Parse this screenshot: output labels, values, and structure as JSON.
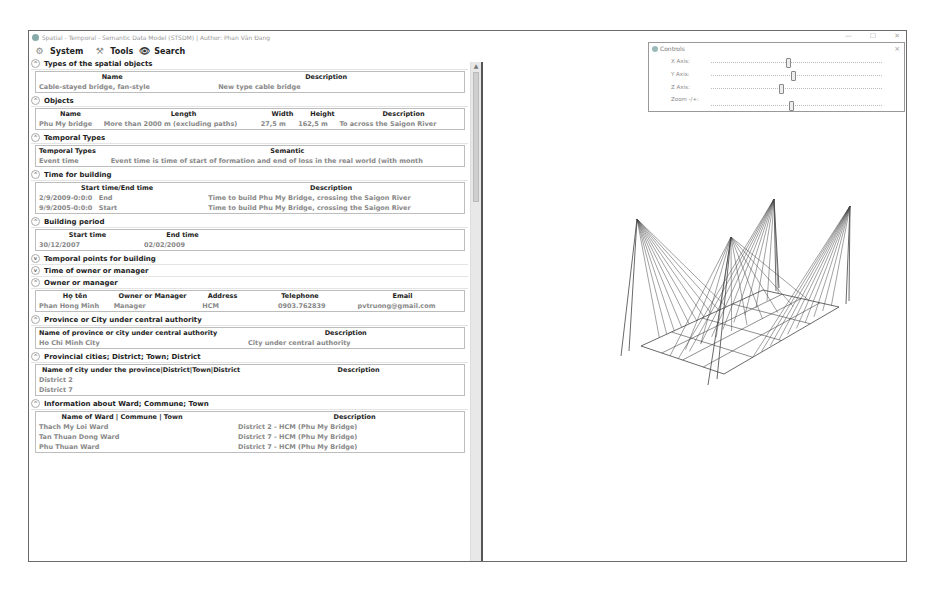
{
  "window": {
    "title": "Spatial - Temporal - Semantic Data Model (STSDM) | Author: Phan Văn Đang",
    "buttons": {
      "minimize": "—",
      "maximize": "☐",
      "close": "✕"
    }
  },
  "toolbar": {
    "system_label": "System",
    "tools_label": "Tools",
    "search_label": "Search"
  },
  "sections": {
    "spatial_types": {
      "title": "Types of the spatial objects",
      "headers": [
        "Name",
        "Description"
      ],
      "rows": [
        [
          "Cable-stayed bridge, fan-style",
          "New type cable bridge"
        ]
      ]
    },
    "objects": {
      "title": "Objects",
      "headers": [
        "Name",
        "Length",
        "Width",
        "Height",
        "Description"
      ],
      "rows": [
        [
          "Phu My bridge",
          "More than 2000 m (excluding paths)",
          "27,5 m",
          "162,5 m",
          "To across the Saigon River"
        ]
      ]
    },
    "temporal_types": {
      "title": "Temporal Types",
      "headers": [
        "Temporal Types",
        "Semantic"
      ],
      "rows": [
        [
          "Event time",
          "Event time is time of start of formation and end of loss in the real world (with month"
        ]
      ]
    },
    "time_building": {
      "title": "Time for building",
      "headers": [
        "Start time/End time",
        "Description"
      ],
      "rows": [
        [
          "2/9/2009-0:0:0",
          "End",
          "Time to build Phu My Bridge, crossing the Saigon River"
        ],
        [
          "9/9/2005-0:0:0",
          "Start",
          "Time to build Phu My Bridge, crossing the Saigon River"
        ]
      ]
    },
    "building_period": {
      "title": "Building period",
      "headers": [
        "Start time",
        "End time"
      ],
      "rows": [
        [
          "30/12/2007",
          "02/02/2009"
        ]
      ]
    },
    "temporal_points": {
      "title": "Temporal points for building"
    },
    "time_owner": {
      "title": "Time of owner or manager"
    },
    "owner": {
      "title": "Owner or manager",
      "headers": [
        "Họ tên",
        "Owner or Manager",
        "Address",
        "Telephone",
        "Email"
      ],
      "rows": [
        [
          "Phan Hong Minh",
          "Manager",
          "HCM",
          "0903.762839",
          "pvtruong@gmail.com"
        ]
      ]
    },
    "province": {
      "title": "Province or City under central authority",
      "headers": [
        "Name of province or city under central authority",
        "Description"
      ],
      "rows": [
        [
          "Ho Chi Minh City",
          "City under central authority"
        ]
      ]
    },
    "district": {
      "title": "Provincial cities; District; Town; District",
      "headers": [
        "Name of city under the province|District|Town|District",
        "Description"
      ],
      "rows": [
        [
          "District 2",
          ""
        ],
        [
          "District 7",
          ""
        ]
      ]
    },
    "ward": {
      "title": "Information about Ward; Commune; Town",
      "headers": [
        "Name of Ward | Commune | Town",
        "Description"
      ],
      "rows": [
        [
          "Thach My Loi Ward",
          "District 2 - HCM (Phu My Bridge)"
        ],
        [
          "Tan Thuan Dong Ward",
          "District 7 - HCM (Phu My Bridge)"
        ],
        [
          "Phu Thuan Ward",
          "District 7 - HCM (Phu My Bridge)"
        ]
      ]
    }
  },
  "controls": {
    "title": "Controls",
    "close": "×",
    "x_axis_label": "X Axis:",
    "y_axis_label": "Y Axis:",
    "z_axis_label": "Z Axis:",
    "zoom_label": "Zoom -/+:",
    "x_axis_pos": 0.45,
    "y_axis_pos": 0.48,
    "z_axis_pos": 0.41,
    "zoom_pos": 0.47
  },
  "colors": {
    "line": "#444444",
    "data_text": "#888888",
    "header_text": "#222222"
  }
}
